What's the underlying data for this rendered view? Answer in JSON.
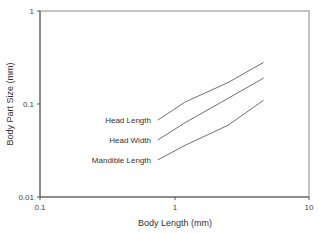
{
  "chart_data": {
    "type": "line",
    "title": "",
    "xlabel": "Body Length (mm)",
    "ylabel": "Body Part Size (mm)",
    "xscale": "log",
    "yscale": "log",
    "xlim": [
      0.1,
      10
    ],
    "ylim": [
      0.01,
      1
    ],
    "x_ticks": [
      "0.1",
      "1",
      "10"
    ],
    "y_ticks": [
      "0.01",
      "0.1",
      "1"
    ],
    "grid": false,
    "legend": "inline labels at left end of each line",
    "series": [
      {
        "name": "Head Length",
        "x": [
          0.75,
          1.2,
          2.5,
          4.6
        ],
        "values": [
          0.067,
          0.105,
          0.17,
          0.28
        ]
      },
      {
        "name": "Head Width",
        "x": [
          0.75,
          1.2,
          2.5,
          4.6
        ],
        "values": [
          0.041,
          0.063,
          0.115,
          0.19
        ]
      },
      {
        "name": "Mandible Length",
        "x": [
          0.75,
          1.2,
          2.5,
          4.6
        ],
        "values": [
          0.025,
          0.036,
          0.059,
          0.11
        ]
      }
    ]
  },
  "colors": {
    "axis": "#666666",
    "line": "#707070",
    "text": "#333333"
  }
}
